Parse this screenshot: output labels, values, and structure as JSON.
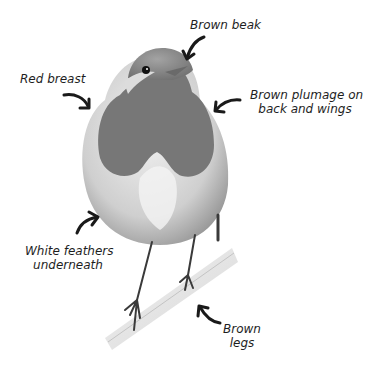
{
  "diagram": {
    "colors": {
      "background": "#ffffff",
      "text": "#1e1e1e",
      "arrow": "#1a1a1a",
      "breast": "#7a7a7a",
      "head_back": "#8c8c8c",
      "belly": "#e6e6e6",
      "branch": "#dadada"
    },
    "labels": {
      "beak": {
        "line1": "Brown beak",
        "line2": ""
      },
      "breast": {
        "line1": "Red breast",
        "line2": ""
      },
      "plumage": {
        "line1": "Brown plumage on",
        "line2": "back and wings"
      },
      "underneath": {
        "line1": "White feathers",
        "line2": "underneath"
      },
      "legs": {
        "line1": "Brown",
        "line2": "legs"
      }
    }
  }
}
